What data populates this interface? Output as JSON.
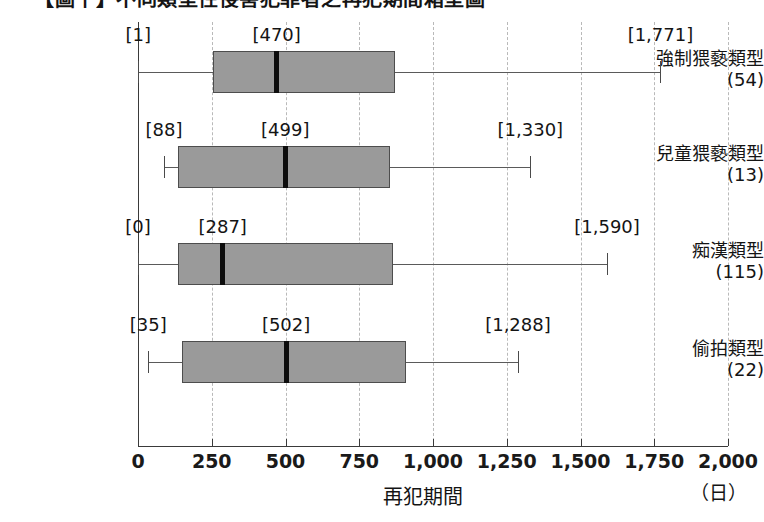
{
  "title": "【圖十】不同類型性侵害犯罪者之再犯期間箱型圖",
  "chart_data": {
    "type": "box",
    "title": "【圖十】不同類型性侵害犯罪者之再犯期間箱型圖",
    "xlabel": "再犯期間",
    "unit": "（日）",
    "ylabel": "",
    "xlim": [
      0,
      2000
    ],
    "xticks": [
      0,
      250,
      500,
      750,
      1000,
      1250,
      1500,
      1750,
      2000
    ],
    "xtick_labels": [
      "0",
      "250",
      "500",
      "750",
      "1,000",
      "1,250",
      "1,500",
      "1,750",
      "2,000"
    ],
    "grid": "vertical-dashed",
    "legend": "none",
    "categories": [
      {
        "label": "強制猥褻類型",
        "n_label": "(54)",
        "n": 54,
        "min": 1,
        "q1": 255,
        "median": 470,
        "q3": 870,
        "max": 1771,
        "min_label": "[1]",
        "median_label": "[470]",
        "max_label": "[1,771]"
      },
      {
        "label": "兒童猥褻類型",
        "n_label": "(13)",
        "n": 13,
        "min": 88,
        "q1": 135,
        "median": 499,
        "q3": 855,
        "max": 1330,
        "min_label": "[88]",
        "median_label": "[499]",
        "max_label": "[1,330]"
      },
      {
        "label": "痴漢類型",
        "n_label": "(115)",
        "n": 115,
        "min": 0,
        "q1": 135,
        "median": 287,
        "q3": 865,
        "max": 1590,
        "min_label": "[0]",
        "median_label": "[287]",
        "max_label": "[1,590]"
      },
      {
        "label": "偷拍類型",
        "n_label": "(22)",
        "n": 22,
        "min": 35,
        "q1": 150,
        "median": 502,
        "q3": 910,
        "max": 1288,
        "min_label": "[35]",
        "median_label": "[502]",
        "max_label": "[1,288]"
      }
    ],
    "colors": {
      "box_fill": "#9a9a9a",
      "box_stroke": "#4d4d4d",
      "median": "#0d0d0d",
      "grid": "#b9b9b9",
      "axis": "#3a3a3a",
      "background": "#ffffff"
    }
  }
}
